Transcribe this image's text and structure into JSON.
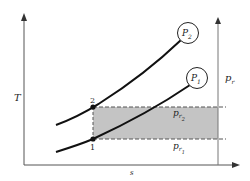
{
  "diagram": {
    "type": "T-s diagram",
    "axes": {
      "y_label": "T",
      "x_label": "s",
      "right_label": "p",
      "right_label_sub": "r"
    },
    "curves": [
      {
        "id": "P2",
        "label": "P",
        "sub": "2"
      },
      {
        "id": "P1",
        "label": "P",
        "sub": "1"
      }
    ],
    "points": [
      {
        "id": "2",
        "label": "2"
      },
      {
        "id": "1",
        "label": "1"
      }
    ],
    "levels": [
      {
        "label": "p",
        "sub": "r",
        "subsub": "2"
      },
      {
        "label": "p",
        "sub": "r",
        "subsub": "1"
      }
    ],
    "colors": {
      "line": "#111111",
      "shade": "#c4c4c4",
      "dash": "#555555"
    }
  }
}
